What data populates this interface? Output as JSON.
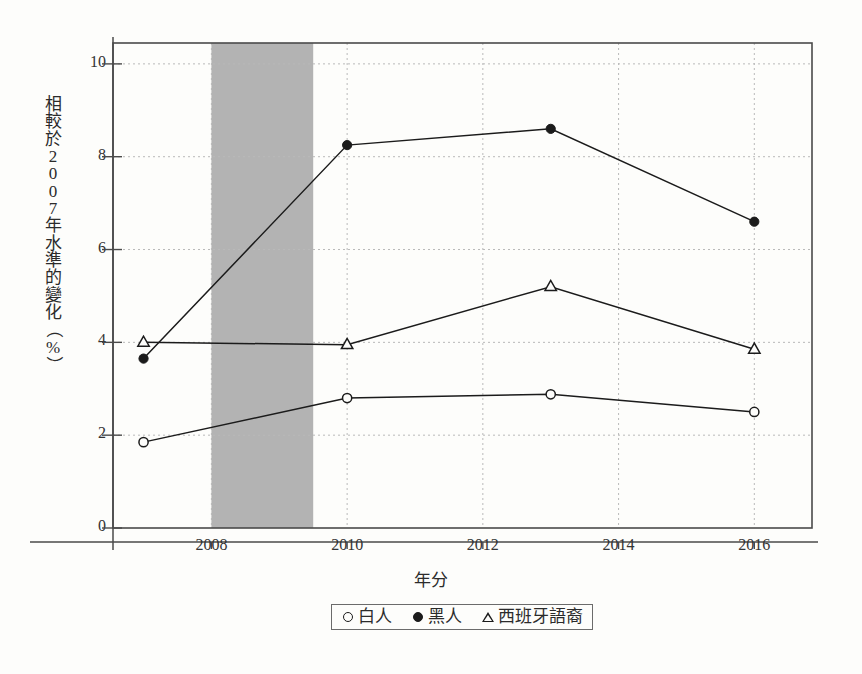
{
  "chart_data": {
    "type": "line",
    "title": "",
    "xlabel": "年分",
    "ylabel": "相較於2007年水準的變化（%）",
    "ylabel_chars": [
      "相",
      "較",
      "於",
      "2",
      "0",
      "0",
      "7",
      "年",
      "水",
      "準",
      "的",
      "變",
      "化",
      "（",
      "%",
      "）"
    ],
    "xlim": [
      2006.55,
      2016.85
    ],
    "ylim": [
      0,
      10.45
    ],
    "grid": true,
    "legend_position": "below-center",
    "x": [
      2007,
      2010,
      2013,
      2016
    ],
    "xticks": [
      2008,
      2010,
      2012,
      2014,
      2016
    ],
    "xtick_labels": [
      "2008",
      "2010",
      "2012",
      "2014",
      "2016"
    ],
    "yticks": [
      0,
      2,
      4,
      6,
      8,
      10
    ],
    "ytick_labels": [
      "0",
      "2",
      "4",
      "6",
      "8",
      "10"
    ],
    "series": [
      {
        "name": "白人",
        "marker": "open-circle",
        "values": [
          1.85,
          2.8,
          2.88,
          2.5
        ]
      },
      {
        "name": "黑人",
        "marker": "filled-circle",
        "values": [
          3.65,
          8.25,
          8.6,
          6.6
        ]
      },
      {
        "name": "西班牙語裔",
        "marker": "open-triangle",
        "values": [
          4.0,
          3.95,
          5.2,
          3.85
        ]
      }
    ],
    "shaded_region": {
      "name": "recession-band",
      "x_start": 2008.0,
      "x_end": 2009.5,
      "color": "#b3b3b3"
    },
    "colors": {
      "line": "#1b1b1b",
      "grid": "#b9b9b9",
      "axis": "#4a4a4a",
      "background": "#fdfdfb",
      "shade": "#b3b3b3"
    }
  },
  "legend": {
    "items": [
      {
        "label": "白人",
        "marker": "open-circle"
      },
      {
        "label": "黑人",
        "marker": "filled-circle"
      },
      {
        "label": "西班牙語裔",
        "marker": "open-triangle"
      }
    ]
  }
}
